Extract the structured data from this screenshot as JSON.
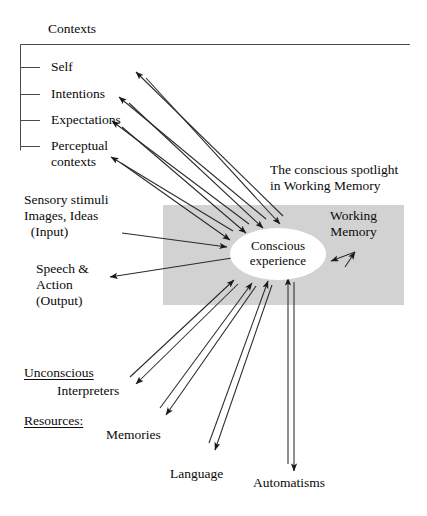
{
  "diagram": {
    "title_top": "Contexts",
    "contexts": {
      "items": [
        {
          "label": "Self"
        },
        {
          "label": "Intentions"
        },
        {
          "label": "Expectations"
        },
        {
          "label": "Perceptual\ncontexts"
        }
      ]
    },
    "inputs": {
      "label": "Sensory stimuli\nImages, Ideas\n  (Input)"
    },
    "outputs": {
      "label": "Speech &\nAction\n(Output)"
    },
    "unconscious": {
      "heading_line1": "Unconscious",
      "heading_line2": "Resources:",
      "items": [
        {
          "label": "Interpreters"
        },
        {
          "label": "Memories"
        },
        {
          "label": "Language"
        },
        {
          "label": "Automatisms"
        }
      ]
    },
    "spotlight_caption": "The conscious spotlight\nin Working Memory",
    "working_memory_label": "Working\nMemory",
    "center_node": {
      "line1": "Conscious",
      "line2": "experience"
    },
    "colors": {
      "band_gray": "#d2d2d2",
      "ink": "#0a0a0a",
      "page": "#ffffff"
    }
  }
}
